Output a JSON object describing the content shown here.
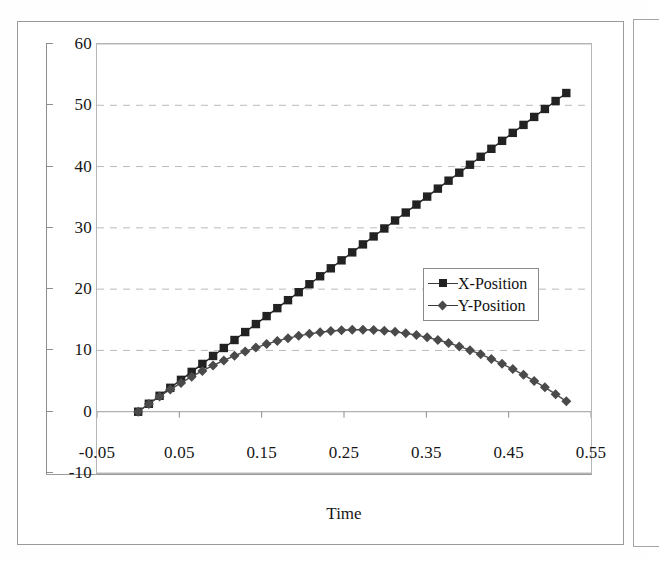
{
  "chart_data": {
    "type": "line",
    "title": "",
    "xlabel": "Time",
    "ylabel": "",
    "xlim": [
      -0.05,
      0.55
    ],
    "ylim": [
      -10,
      60
    ],
    "xticks": [
      -0.05,
      0.05,
      0.15,
      0.25,
      0.35,
      0.45,
      0.55
    ],
    "xtick_labels": [
      "-0.05",
      "0.05",
      "0.15",
      "0.25",
      "0.35",
      "0.45",
      "0.55"
    ],
    "yticks": [
      -10,
      0,
      10,
      20,
      30,
      40,
      50,
      60
    ],
    "ytick_labels": [
      "-10",
      "0",
      "10",
      "20",
      "30",
      "40",
      "50",
      "60"
    ],
    "grid": "horizontal-dashed",
    "legend_position": "center-right",
    "x": [
      0.0,
      0.013,
      0.026,
      0.039,
      0.052,
      0.065,
      0.078,
      0.091,
      0.104,
      0.117,
      0.13,
      0.143,
      0.156,
      0.169,
      0.182,
      0.195,
      0.208,
      0.221,
      0.234,
      0.247,
      0.26,
      0.273,
      0.286,
      0.299,
      0.312,
      0.325,
      0.338,
      0.351,
      0.364,
      0.377,
      0.39,
      0.403,
      0.416,
      0.429,
      0.442,
      0.455,
      0.468,
      0.481,
      0.494,
      0.507,
      0.52
    ],
    "series": [
      {
        "name": "X-Position",
        "marker": "square",
        "color": "#222222",
        "values": [
          0.0,
          1.3,
          2.6,
          3.9,
          5.2,
          6.5,
          7.8,
          9.1,
          10.4,
          11.7,
          13.0,
          14.3,
          15.6,
          16.9,
          18.2,
          19.5,
          20.8,
          22.1,
          23.4,
          24.7,
          26.0,
          27.3,
          28.6,
          29.9,
          31.2,
          32.5,
          33.8,
          35.1,
          36.4,
          37.7,
          39.0,
          40.3,
          41.6,
          42.9,
          44.2,
          45.5,
          46.8,
          48.1,
          49.4,
          50.7,
          52.0
        ]
      },
      {
        "name": "Y-Position",
        "marker": "diamond",
        "color": "#4a4a4a",
        "values": [
          0.0,
          1.27,
          2.48,
          3.62,
          4.69,
          5.71,
          6.66,
          7.54,
          8.37,
          9.13,
          9.83,
          10.46,
          11.04,
          11.55,
          12.0,
          12.38,
          12.71,
          12.97,
          13.17,
          13.3,
          13.38,
          13.39,
          13.33,
          13.22,
          13.04,
          12.8,
          12.5,
          12.13,
          11.7,
          11.21,
          10.66,
          10.04,
          9.36,
          8.62,
          7.82,
          6.95,
          6.02,
          5.03,
          3.98,
          2.86,
          1.69
        ]
      }
    ]
  },
  "axis": {
    "x_title": "Time"
  },
  "legend": {
    "entries": [
      {
        "label": "X-Position",
        "marker": "square-marker"
      },
      {
        "label": "Y-Position",
        "marker": "diamond-marker"
      }
    ]
  }
}
